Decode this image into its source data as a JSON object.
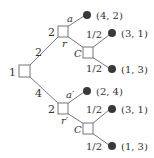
{
  "diagram": {
    "type": "game-tree",
    "root": {
      "player_label": "1",
      "edges": [
        {
          "label": "2",
          "to": "upper"
        },
        {
          "label": "4",
          "to": "lower"
        }
      ]
    },
    "upper": {
      "player_label": "2",
      "action_accept": "a",
      "action_reject": "r",
      "accept_payoff": "(4, 2)",
      "chance": {
        "label": "C",
        "branches": [
          {
            "prob": "1/2",
            "payoff": "(3, 1)"
          },
          {
            "prob": "1/2",
            "payoff": "(1, 3)"
          }
        ]
      }
    },
    "lower": {
      "player_label": "2",
      "action_accept": "a′",
      "action_reject": "r′",
      "accept_payoff": "(2, 4)",
      "chance": {
        "label": "C",
        "branches": [
          {
            "prob": "1/2",
            "payoff": "(3, 1)"
          },
          {
            "prob": "1/2",
            "payoff": "(1, 3)"
          }
        ]
      }
    }
  }
}
